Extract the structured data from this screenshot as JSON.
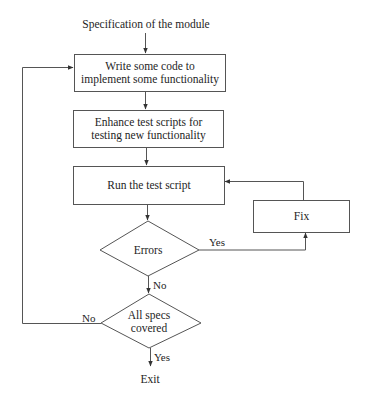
{
  "diagram": {
    "type": "flowchart",
    "start_label": "Specification of the module",
    "nodes": [
      {
        "id": "write_code",
        "shape": "rect",
        "lines": [
          "Write some code to",
          "implement some functionality"
        ]
      },
      {
        "id": "enhance_tests",
        "shape": "rect",
        "lines": [
          "Enhance test scripts for",
          "testing new functionality"
        ]
      },
      {
        "id": "run_tests",
        "shape": "rect",
        "lines": [
          "Run the test script"
        ]
      },
      {
        "id": "fix",
        "shape": "rect",
        "lines": [
          "Fix"
        ]
      },
      {
        "id": "errors",
        "shape": "diamond",
        "lines": [
          "Errors"
        ]
      },
      {
        "id": "all_specs",
        "shape": "diamond",
        "lines": [
          "All specs",
          "covered"
        ]
      }
    ],
    "edges": [
      {
        "from": "start",
        "to": "write_code",
        "label": ""
      },
      {
        "from": "write_code",
        "to": "enhance_tests",
        "label": ""
      },
      {
        "from": "enhance_tests",
        "to": "run_tests",
        "label": ""
      },
      {
        "from": "run_tests",
        "to": "errors",
        "label": ""
      },
      {
        "from": "errors",
        "to": "fix",
        "label": "Yes"
      },
      {
        "from": "fix",
        "to": "run_tests",
        "label": ""
      },
      {
        "from": "errors",
        "to": "all_specs",
        "label": "No"
      },
      {
        "from": "all_specs",
        "to": "write_code",
        "label": "No"
      },
      {
        "from": "all_specs",
        "to": "exit",
        "label": "Yes"
      }
    ],
    "end_label": "Exit",
    "edge_labels": {
      "errors_yes": "Yes",
      "errors_no": "No",
      "specs_no": "No",
      "specs_yes": "Yes"
    }
  }
}
